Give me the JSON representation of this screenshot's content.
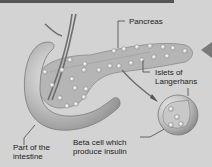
{
  "diagram": {
    "labels": {
      "pancreas": "Pancreas",
      "islets_line1": "Islets of",
      "islets_line2": "Langerhans",
      "intestine_line1": "Part of the",
      "intestine_line2": "intestine",
      "beta_line1": "Beta cell which",
      "beta_line2": "produce insulin"
    },
    "colors": {
      "background": "#d3d3d3",
      "organ": "#b8b8b8",
      "islet": "#efefef",
      "text": "#222222",
      "arrow": "#707070"
    }
  }
}
